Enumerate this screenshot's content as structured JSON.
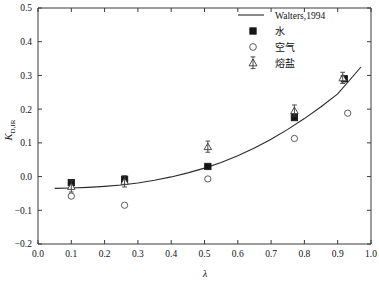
{
  "chart_data": {
    "type": "scatter",
    "title": "",
    "xlabel": "λ",
    "ylabel": "K",
    "ylabel_sub": "D,IR",
    "xlim": [
      0.0,
      1.0
    ],
    "ylim": [
      -0.2,
      0.5
    ],
    "grid": false,
    "xticks": [
      "0.0",
      "0.1",
      "0.2",
      "0.3",
      "0.4",
      "0.5",
      "0.6",
      "0.7",
      "0.8",
      "0.9",
      "1.0"
    ],
    "yticks": [
      "-0.2",
      "-0.1",
      "0.0",
      "0.1",
      "0.2",
      "0.3",
      "0.4",
      "0.5"
    ],
    "legend_position": "top-right",
    "series": [
      {
        "name": "Walters,1994",
        "marker": "line",
        "type": "line",
        "x": [
          0.05,
          0.1,
          0.15,
          0.2,
          0.25,
          0.3,
          0.35,
          0.4,
          0.45,
          0.5,
          0.55,
          0.6,
          0.65,
          0.7,
          0.75,
          0.8,
          0.85,
          0.9,
          0.97
        ],
        "y": [
          -0.035,
          -0.034,
          -0.032,
          -0.029,
          -0.025,
          -0.019,
          -0.011,
          -0.001,
          0.011,
          0.025,
          0.042,
          0.062,
          0.085,
          0.111,
          0.14,
          0.172,
          0.207,
          0.245,
          0.325
        ]
      },
      {
        "name": "水",
        "marker": "filled-square",
        "type": "scatter",
        "x": [
          0.1,
          0.26,
          0.51,
          0.77,
          0.92
        ],
        "y": [
          -0.018,
          -0.008,
          0.03,
          0.175,
          0.29
        ]
      },
      {
        "name": "空气",
        "marker": "open-circle",
        "type": "scatter",
        "x": [
          0.1,
          0.26,
          0.51,
          0.77,
          0.93
        ],
        "y": [
          -0.058,
          -0.085,
          -0.007,
          0.113,
          0.188
        ]
      },
      {
        "name": "熔盐",
        "marker": "open-triangle-stem",
        "type": "scatter",
        "x": [
          0.1,
          0.26,
          0.51,
          0.77,
          0.915
        ],
        "y": [
          -0.03,
          -0.015,
          0.088,
          0.195,
          0.292
        ]
      }
    ]
  },
  "legend": {
    "entries": [
      {
        "label": "Walters,1994",
        "marker": "line"
      },
      {
        "label": "水",
        "marker": "filled-square"
      },
      {
        "label": "空气",
        "marker": "open-circle"
      },
      {
        "label": "熔盐",
        "marker": "open-triangle-stem"
      }
    ]
  },
  "colors": {
    "axis": "#3b3b3b",
    "curve": "#2a2a2a",
    "square": "#151515",
    "circle_stroke": "#4a4a4a",
    "triangle_stroke": "#3a3a3a",
    "background": "#ffffff"
  }
}
